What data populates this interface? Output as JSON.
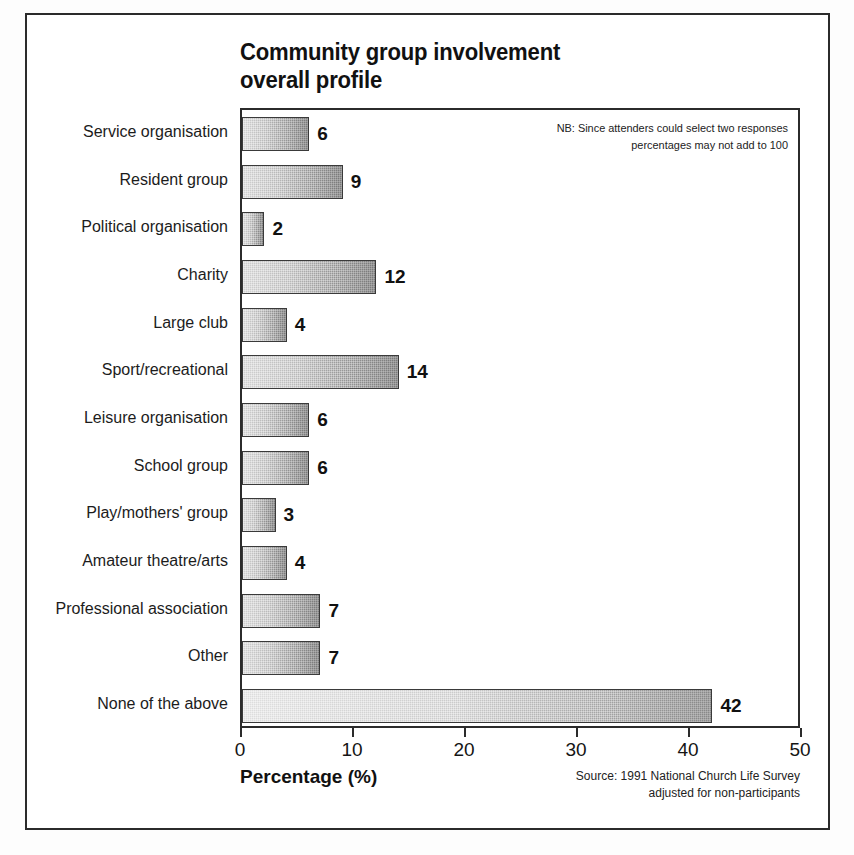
{
  "figure": {
    "background_color": "#ffffff",
    "border_color": "#2b2b2b",
    "bar_fill_color": "#9a9a9a",
    "text_color": "#1a1a1a"
  },
  "title": "Community group involvement\noverall profile",
  "note": "NB: Since attenders could select two responses\npercentages may not add to 100",
  "axis_title": "Percentage (%)",
  "source": "Source: 1991 National Church Life Survey\nadjusted for non-participants",
  "chart_data": {
    "type": "bar",
    "orientation": "horizontal",
    "title": "Community group involvement overall profile",
    "xlabel": "Percentage (%)",
    "ylabel": "",
    "xlim": [
      0,
      50
    ],
    "xticks": [
      0,
      10,
      20,
      30,
      40,
      50
    ],
    "xtick_labels": [
      "0",
      "10",
      "20",
      "30",
      "40",
      "50"
    ],
    "grid": false,
    "legend": false,
    "annotations": [
      "NB: Since attenders could select two responses percentages may not add to 100",
      "Source: 1991 National Church Life Survey adjusted for non-participants"
    ],
    "categories": [
      "Service organisation",
      "Resident group",
      "Political organisation",
      "Charity",
      "Large club",
      "Sport/recreational",
      "Leisure organisation",
      "School group",
      "Play/mothers' group",
      "Amateur theatre/arts",
      "Professional association",
      "Other",
      "None of the above"
    ],
    "values": [
      6,
      9,
      2,
      12,
      4,
      14,
      6,
      6,
      3,
      4,
      7,
      7,
      42
    ],
    "value_labels": [
      "6",
      "9",
      "2",
      "12",
      "4",
      "14",
      "6",
      "6",
      "3",
      "4",
      "7",
      "7",
      "42"
    ]
  }
}
